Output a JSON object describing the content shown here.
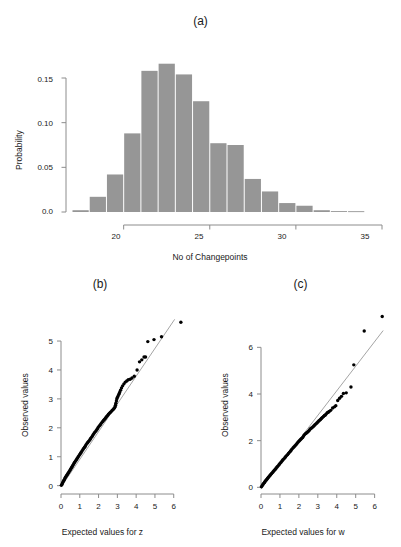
{
  "figure": {
    "panels": [
      {
        "label": "(a)"
      },
      {
        "label": "(b)"
      },
      {
        "label": "(c)"
      }
    ]
  },
  "colors": {
    "bar_fill": "#969696",
    "axis": "#8c8c8c",
    "point": "#000000",
    "reference_line": "#9a9a9a",
    "text": "#1a1a1a",
    "background": "#ffffff"
  },
  "chart_data": [
    {
      "id": "panel-a-histogram",
      "type": "bar",
      "title": "(a)",
      "xlabel": "No of Changepoints",
      "ylabel": "Probability",
      "grid": false,
      "legend": "none",
      "xlim": [
        17,
        35
      ],
      "ylim": [
        0.0,
        0.175
      ],
      "xticks": [
        20,
        25,
        30,
        35
      ],
      "xtick_labels": [
        "20",
        "25",
        "30",
        "35"
      ],
      "yticks": [
        0.0,
        0.05,
        0.1,
        0.15
      ],
      "ytick_labels": [
        "0.0",
        "0.05",
        "0.10",
        "0.15"
      ],
      "bin_width": 1,
      "categories": [
        17,
        18,
        19,
        20,
        21,
        22,
        23,
        24,
        25,
        26,
        27,
        28,
        29,
        30,
        31,
        32,
        33
      ],
      "values": [
        0.002,
        0.017,
        0.042,
        0.088,
        0.158,
        0.166,
        0.154,
        0.124,
        0.077,
        0.075,
        0.037,
        0.023,
        0.01,
        0.007,
        0.002,
        0.001,
        0.0
      ]
    },
    {
      "id": "panel-b-qqplot",
      "type": "scatter",
      "title": "(b)",
      "xlabel": "Expected values for z",
      "ylabel": "Observed values",
      "grid": false,
      "legend": "none",
      "xlim": [
        0,
        6.6
      ],
      "ylim": [
        -0.15,
        5.9
      ],
      "xticks": [
        0,
        1,
        2,
        3,
        4,
        5,
        6
      ],
      "xtick_labels": [
        "0",
        "1",
        "2",
        "3",
        "4",
        "5",
        "6"
      ],
      "yticks": [
        0,
        1,
        2,
        3,
        4,
        5
      ],
      "ytick_labels": [
        "0",
        "1",
        "2",
        "3",
        "4",
        "5"
      ],
      "reference_line": {
        "x": [
          0.0,
          6.05
        ],
        "y": [
          -0.05,
          5.75
        ]
      },
      "points": [
        [
          0.02,
          0.01
        ],
        [
          0.05,
          0.05
        ],
        [
          0.08,
          0.09
        ],
        [
          0.11,
          0.13
        ],
        [
          0.14,
          0.17
        ],
        [
          0.17,
          0.2
        ],
        [
          0.2,
          0.24
        ],
        [
          0.23,
          0.28
        ],
        [
          0.26,
          0.31
        ],
        [
          0.3,
          0.35
        ],
        [
          0.33,
          0.38
        ],
        [
          0.36,
          0.41
        ],
        [
          0.4,
          0.45
        ],
        [
          0.43,
          0.48
        ],
        [
          0.47,
          0.52
        ],
        [
          0.5,
          0.56
        ],
        [
          0.54,
          0.6
        ],
        [
          0.57,
          0.64
        ],
        [
          0.61,
          0.68
        ],
        [
          0.65,
          0.72
        ],
        [
          0.68,
          0.76
        ],
        [
          0.72,
          0.8
        ],
        [
          0.76,
          0.84
        ],
        [
          0.8,
          0.88
        ],
        [
          0.84,
          0.92
        ],
        [
          0.88,
          0.96
        ],
        [
          0.92,
          1.0
        ],
        [
          0.96,
          1.04
        ],
        [
          1.0,
          1.08
        ],
        [
          1.04,
          1.12
        ],
        [
          1.08,
          1.16
        ],
        [
          1.12,
          1.2
        ],
        [
          1.17,
          1.25
        ],
        [
          1.21,
          1.29
        ],
        [
          1.25,
          1.33
        ],
        [
          1.3,
          1.37
        ],
        [
          1.34,
          1.42
        ],
        [
          1.39,
          1.47
        ],
        [
          1.43,
          1.5
        ],
        [
          1.48,
          1.54
        ],
        [
          1.53,
          1.58
        ],
        [
          1.57,
          1.62
        ],
        [
          1.62,
          1.67
        ],
        [
          1.67,
          1.72
        ],
        [
          1.72,
          1.77
        ],
        [
          1.77,
          1.82
        ],
        [
          1.82,
          1.86
        ],
        [
          1.87,
          1.9
        ],
        [
          1.92,
          1.95
        ],
        [
          1.97,
          2.0
        ],
        [
          2.02,
          2.05
        ],
        [
          2.07,
          2.09
        ],
        [
          2.12,
          2.13
        ],
        [
          2.17,
          2.18
        ],
        [
          2.22,
          2.22
        ],
        [
          2.27,
          2.26
        ],
        [
          2.32,
          2.3
        ],
        [
          2.37,
          2.34
        ],
        [
          2.42,
          2.38
        ],
        [
          2.47,
          2.42
        ],
        [
          2.52,
          2.46
        ],
        [
          2.57,
          2.5
        ],
        [
          2.62,
          2.53
        ],
        [
          2.67,
          2.56
        ],
        [
          2.72,
          2.6
        ],
        [
          2.77,
          2.63
        ],
        [
          2.81,
          2.66
        ],
        [
          2.85,
          2.69
        ],
        [
          2.88,
          2.73
        ],
        [
          2.9,
          2.78
        ],
        [
          2.92,
          2.85
        ],
        [
          2.95,
          2.93
        ],
        [
          2.97,
          3.0
        ],
        [
          3.0,
          3.05
        ],
        [
          3.04,
          3.1
        ],
        [
          3.08,
          3.16
        ],
        [
          3.12,
          3.22
        ],
        [
          3.17,
          3.3
        ],
        [
          3.22,
          3.38
        ],
        [
          3.28,
          3.45
        ],
        [
          3.35,
          3.52
        ],
        [
          3.42,
          3.58
        ],
        [
          3.5,
          3.62
        ],
        [
          3.58,
          3.66
        ],
        [
          3.68,
          3.68
        ],
        [
          3.78,
          3.72
        ],
        [
          3.9,
          3.78
        ],
        [
          4.05,
          4.0
        ],
        [
          4.18,
          4.28
        ],
        [
          4.3,
          4.35
        ],
        [
          4.42,
          4.45
        ],
        [
          4.5,
          4.45
        ],
        [
          4.62,
          4.98
        ],
        [
          4.95,
          5.05
        ],
        [
          5.35,
          5.15
        ],
        [
          6.38,
          5.65
        ]
      ]
    },
    {
      "id": "panel-c-qqplot",
      "type": "scatter",
      "title": "(c)",
      "xlabel": "Expected values for w",
      "ylabel": "Observed values",
      "grid": false,
      "legend": "none",
      "xlim": [
        0,
        6.6
      ],
      "ylim": [
        -0.2,
        7.6
      ],
      "xticks": [
        0,
        1,
        2,
        3,
        4,
        5,
        6
      ],
      "xtick_labels": [
        "0",
        "1",
        "2",
        "3",
        "4",
        "5",
        "6"
      ],
      "yticks": [
        0,
        2,
        4,
        6
      ],
      "ytick_labels": [
        "0",
        "2",
        "4",
        "6"
      ],
      "reference_line": {
        "x": [
          0.0,
          6.45
        ],
        "y": [
          -0.08,
          6.72
        ]
      },
      "points": [
        [
          0.02,
          0.02
        ],
        [
          0.06,
          0.07
        ],
        [
          0.1,
          0.12
        ],
        [
          0.14,
          0.17
        ],
        [
          0.18,
          0.21
        ],
        [
          0.22,
          0.26
        ],
        [
          0.26,
          0.3
        ],
        [
          0.3,
          0.34
        ],
        [
          0.34,
          0.38
        ],
        [
          0.38,
          0.42
        ],
        [
          0.42,
          0.46
        ],
        [
          0.46,
          0.5
        ],
        [
          0.5,
          0.54
        ],
        [
          0.55,
          0.58
        ],
        [
          0.59,
          0.62
        ],
        [
          0.63,
          0.66
        ],
        [
          0.67,
          0.7
        ],
        [
          0.72,
          0.74
        ],
        [
          0.76,
          0.78
        ],
        [
          0.8,
          0.83
        ],
        [
          0.85,
          0.87
        ],
        [
          0.89,
          0.91
        ],
        [
          0.94,
          0.96
        ],
        [
          0.98,
          1.0
        ],
        [
          1.03,
          1.05
        ],
        [
          1.07,
          1.09
        ],
        [
          1.12,
          1.14
        ],
        [
          1.16,
          1.18
        ],
        [
          1.21,
          1.22
        ],
        [
          1.26,
          1.27
        ],
        [
          1.3,
          1.31
        ],
        [
          1.35,
          1.36
        ],
        [
          1.4,
          1.4
        ],
        [
          1.45,
          1.45
        ],
        [
          1.5,
          1.5
        ],
        [
          1.55,
          1.55
        ],
        [
          1.6,
          1.6
        ],
        [
          1.65,
          1.65
        ],
        [
          1.7,
          1.7
        ],
        [
          1.75,
          1.74
        ],
        [
          1.8,
          1.78
        ],
        [
          1.85,
          1.83
        ],
        [
          1.9,
          1.88
        ],
        [
          1.95,
          1.93
        ],
        [
          2.0,
          1.98
        ],
        [
          2.05,
          2.02
        ],
        [
          2.1,
          2.06
        ],
        [
          2.15,
          2.1
        ],
        [
          2.2,
          2.14
        ],
        [
          2.25,
          2.2
        ],
        [
          2.3,
          2.26
        ],
        [
          2.35,
          2.3
        ],
        [
          2.4,
          2.33
        ],
        [
          2.45,
          2.36
        ],
        [
          2.5,
          2.4
        ],
        [
          2.55,
          2.45
        ],
        [
          2.6,
          2.5
        ],
        [
          2.65,
          2.53
        ],
        [
          2.7,
          2.56
        ],
        [
          2.75,
          2.6
        ],
        [
          2.8,
          2.64
        ],
        [
          2.85,
          2.68
        ],
        [
          2.9,
          2.72
        ],
        [
          2.95,
          2.76
        ],
        [
          3.0,
          2.8
        ],
        [
          3.05,
          2.84
        ],
        [
          3.1,
          2.88
        ],
        [
          3.15,
          2.92
        ],
        [
          3.2,
          2.96
        ],
        [
          3.25,
          3.0
        ],
        [
          3.3,
          3.04
        ],
        [
          3.35,
          3.08
        ],
        [
          3.4,
          3.1
        ],
        [
          3.45,
          3.15
        ],
        [
          3.5,
          3.2
        ],
        [
          3.55,
          3.22
        ],
        [
          3.6,
          3.25
        ],
        [
          3.68,
          3.3
        ],
        [
          3.78,
          3.4
        ],
        [
          3.88,
          3.45
        ],
        [
          3.95,
          3.5
        ],
        [
          4.05,
          3.72
        ],
        [
          4.15,
          3.82
        ],
        [
          4.25,
          3.9
        ],
        [
          4.35,
          4.02
        ],
        [
          4.5,
          4.05
        ],
        [
          4.75,
          4.3
        ],
        [
          4.9,
          5.25
        ],
        [
          5.45,
          6.7
        ],
        [
          6.4,
          7.32
        ]
      ]
    }
  ]
}
